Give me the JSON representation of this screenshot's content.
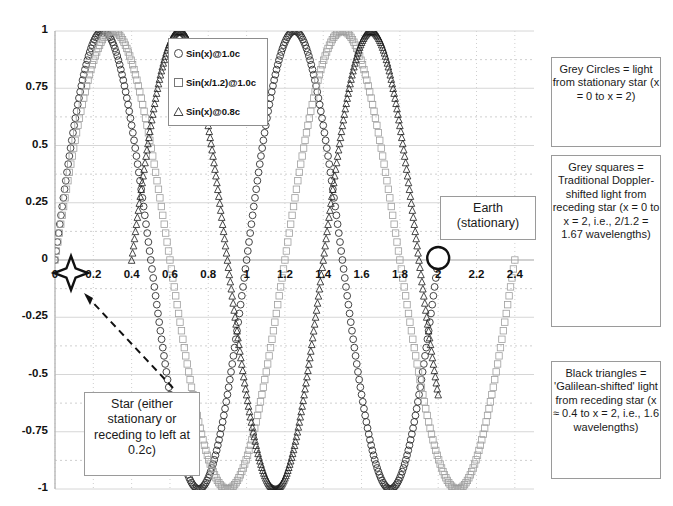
{
  "chart_data": {
    "type": "line",
    "title": "",
    "xlabel": "",
    "ylabel": "",
    "xlim": [
      0,
      2.5
    ],
    "ylim": [
      -1,
      1
    ],
    "grid": true,
    "x_ticks": [
      "0",
      "0.2",
      "0.4",
      "0.6",
      "0.8",
      "1",
      "1.2",
      "1.4",
      "1.6",
      "1.8",
      "2",
      "2.2",
      "2.4"
    ],
    "x_tick_values": [
      0,
      0.2,
      0.4,
      0.6,
      0.8,
      1,
      1.2,
      1.4,
      1.6,
      1.8,
      2,
      2.2,
      2.4
    ],
    "y_ticks": [
      "1",
      "0.75",
      "0.5",
      "0.25",
      "0",
      "-0.25",
      "-0.5",
      "-0.75",
      "-1"
    ],
    "y_tick_values": [
      1,
      0.75,
      0.5,
      0.25,
      0,
      -0.25,
      -0.5,
      -0.75,
      -1
    ],
    "legend_position": "top-center-left",
    "series": [
      {
        "name": "Sin(x)@1.0c",
        "marker": "circle",
        "color": "#303030",
        "formula": "sin(2*pi*x)",
        "wave_scale": 1.0,
        "x_start": 0.0,
        "x_end": 2.0,
        "description": "Grey Circles = light from stationary star (x = 0 to x = 2)"
      },
      {
        "name": "Sin(x/1.2)@1.0c",
        "marker": "square",
        "color": "#9e9e9e",
        "formula": "sin(2*pi*x/1.2)",
        "wave_scale": 1.2,
        "x_start": 0.0,
        "x_end": 2.4,
        "description": "Grey squares = Traditional Doppler-shifted light from receding star"
      },
      {
        "name": "Sin(x)@0.8c",
        "marker": "triangle",
        "color": "#1a1a1a",
        "formula": "sin(2*pi*(x-0.4))",
        "wave_scale": 1.0,
        "x_start": 0.4,
        "x_end": 2.0,
        "phase_shift": 0.4,
        "description": "Black triangles = 'Galilean-shifted' light from receding star"
      }
    ]
  },
  "legend": {
    "items": [
      {
        "label": "Sin(x)@1.0c",
        "marker": "circle-icon"
      },
      {
        "label": "Sin(x/1.2)@1.0c",
        "marker": "square-icon"
      },
      {
        "label": "Sin(x)@0.8c",
        "marker": "triangle-icon"
      }
    ]
  },
  "annotations": {
    "grey_circles": "Grey Circles = light from stationary star (x = 0 to x = 2)",
    "grey_squares": "Grey squares = Traditional Doppler-shifted light from receding star (x = 0 to x = 2, i.e., 2/1.2 = 1.67 wavelengths)",
    "black_triangles": "Black triangles = 'Galilean-shifted' light from receding star (x ≈ 0.4 to x = 2, i.e., 1.6 wavelengths)",
    "earth": "Earth (stationary)",
    "star": "Star (either stationary or receding to left at 0.2c)"
  },
  "markers": {
    "star_glyph": "four-point-star",
    "earth_glyph": "hollow-circle"
  },
  "colors": {
    "axis": "#b8b8b8",
    "grid_solid": "#d6d6d6",
    "grid_dotted": "#cfcfcf",
    "text": "#1a1a1a",
    "box_border": "#9a9a9a",
    "series_dark": "#1a1a1a",
    "series_grey": "#9e9e9e"
  }
}
